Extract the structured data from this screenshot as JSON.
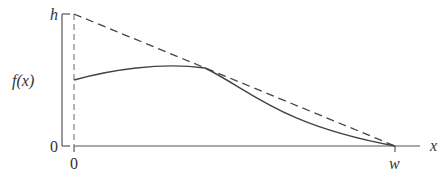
{
  "diagram": {
    "y_axis_label": "f(x)",
    "y_ticks": [
      "h",
      "0"
    ],
    "x_axis_label": "x",
    "x_ticks": [
      "0",
      "w"
    ],
    "lines": [
      {
        "name": "bound",
        "style": "dashed",
        "from": [
          0,
          "h"
        ],
        "to": [
          "w",
          0
        ]
      },
      {
        "name": "f(x)",
        "style": "solid",
        "description": "curve starting below h at x=0, rising slightly, touching the dashed line, then decreasing to 0 at x=w"
      }
    ],
    "colors": {
      "stroke": "#444444"
    }
  }
}
